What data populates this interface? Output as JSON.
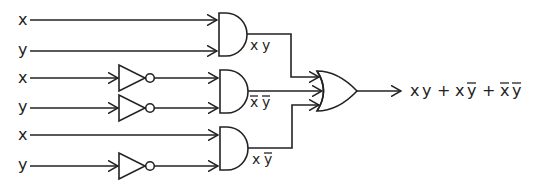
{
  "diagram": {
    "inputs": [
      {
        "label": "x",
        "row_y": 20
      },
      {
        "label": "y",
        "row_y": 51
      },
      {
        "label": "x",
        "row_y": 78
      },
      {
        "label": "y",
        "row_y": 108
      },
      {
        "label": "x",
        "row_y": 135
      },
      {
        "label": "y",
        "row_y": 166
      }
    ],
    "not_gates": [
      {
        "input": "x",
        "row_y": 78
      },
      {
        "input": "y",
        "row_y": 108
      },
      {
        "input": "y",
        "row_y": 166
      }
    ],
    "and_gates": [
      {
        "name": "and-1",
        "inputs": [
          "x",
          "y"
        ],
        "output_label": {
          "a": "x",
          "a_bar": false,
          "b": "y",
          "b_bar": false
        }
      },
      {
        "name": "and-2",
        "inputs": [
          "x̄",
          "ȳ"
        ],
        "output_label": {
          "a": "x",
          "a_bar": true,
          "b": "y",
          "b_bar": true
        }
      },
      {
        "name": "and-3",
        "inputs": [
          "x",
          "ȳ"
        ],
        "output_label": {
          "a": "x",
          "a_bar": false,
          "b": "y",
          "b_bar": true
        }
      }
    ],
    "or_gate": {
      "inputs": 3
    },
    "output_expression": {
      "t1a": "x",
      "t1b": "y",
      "plus1": "+",
      "t2a": "x",
      "t2b": "y",
      "plus2": "+",
      "t3a": "x",
      "t3b": "y",
      "text": "x y + x ȳ + x̄ ȳ"
    },
    "colors": {
      "stroke": "#222222",
      "background": "#ffffff"
    }
  }
}
